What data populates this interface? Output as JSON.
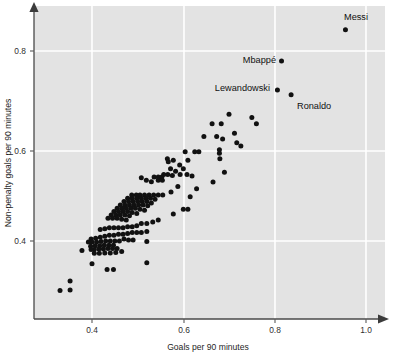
{
  "chart_data": {
    "type": "scatter",
    "title": "",
    "xlabel": "Goals per 90 minutes",
    "ylabel": "Non-penalty goals per 90 minutes",
    "xlim": [
      0.3,
      1.06
    ],
    "ylim": [
      0.28,
      0.9
    ],
    "xticks": [
      0.4,
      0.6,
      0.8,
      1.0
    ],
    "xtick_labels": [
      "0.4",
      "0.6",
      "0.8",
      "1.0"
    ],
    "yticks": [
      0.4,
      0.6,
      0.8
    ],
    "ytick_labels": [
      "0.4",
      "0.6",
      "0.8"
    ],
    "grid": true,
    "grid_color": "#ffffff",
    "plot_background": "#e3e3e3",
    "point_color": "#111111",
    "legend": "none",
    "annotations": [
      {
        "label": "Messi",
        "x": 0.955,
        "y": 0.845,
        "position": "above"
      },
      {
        "label": "Mbappé",
        "x": 0.815,
        "y": 0.779,
        "position": "left"
      },
      {
        "label": "Lewandowski",
        "x": 0.806,
        "y": 0.718,
        "position": "left"
      },
      {
        "label": "Ronaldo",
        "x": 0.836,
        "y": 0.708,
        "position": "right"
      }
    ],
    "points": [
      [
        0.955,
        0.845
      ],
      [
        0.815,
        0.779
      ],
      [
        0.806,
        0.718
      ],
      [
        0.836,
        0.708
      ],
      [
        0.7,
        0.667
      ],
      [
        0.663,
        0.647
      ],
      [
        0.683,
        0.647
      ],
      [
        0.75,
        0.66
      ],
      [
        0.76,
        0.647
      ],
      [
        0.712,
        0.627
      ],
      [
        0.645,
        0.62
      ],
      [
        0.673,
        0.62
      ],
      [
        0.686,
        0.615
      ],
      [
        0.717,
        0.607
      ],
      [
        0.726,
        0.6
      ],
      [
        0.679,
        0.592
      ],
      [
        0.679,
        0.585
      ],
      [
        0.68,
        0.573
      ],
      [
        0.625,
        0.588
      ],
      [
        0.634,
        0.588
      ],
      [
        0.604,
        0.588
      ],
      [
        0.61,
        0.57
      ],
      [
        0.565,
        0.573
      ],
      [
        0.567,
        0.567
      ],
      [
        0.578,
        0.57
      ],
      [
        0.592,
        0.56
      ],
      [
        0.6,
        0.552
      ],
      [
        0.572,
        0.552
      ],
      [
        0.583,
        0.547
      ],
      [
        0.557,
        0.54
      ],
      [
        0.566,
        0.54
      ],
      [
        0.576,
        0.538
      ],
      [
        0.593,
        0.54
      ],
      [
        0.608,
        0.54
      ],
      [
        0.619,
        0.537
      ],
      [
        0.536,
        0.535
      ],
      [
        0.545,
        0.535
      ],
      [
        0.553,
        0.535
      ],
      [
        0.545,
        0.528
      ],
      [
        0.554,
        0.528
      ],
      [
        0.53,
        0.525
      ],
      [
        0.519,
        0.528
      ],
      [
        0.508,
        0.533
      ],
      [
        0.69,
        0.545
      ],
      [
        0.665,
        0.524
      ],
      [
        0.629,
        0.51
      ],
      [
        0.615,
        0.493
      ],
      [
        0.588,
        0.515
      ],
      [
        0.573,
        0.503
      ],
      [
        0.555,
        0.497
      ],
      [
        0.545,
        0.497
      ],
      [
        0.535,
        0.497
      ],
      [
        0.525,
        0.497
      ],
      [
        0.515,
        0.497
      ],
      [
        0.505,
        0.497
      ],
      [
        0.497,
        0.497
      ],
      [
        0.487,
        0.497
      ],
      [
        0.478,
        0.49
      ],
      [
        0.488,
        0.49
      ],
      [
        0.498,
        0.49
      ],
      [
        0.508,
        0.49
      ],
      [
        0.518,
        0.49
      ],
      [
        0.528,
        0.49
      ],
      [
        0.538,
        0.488
      ],
      [
        0.47,
        0.483
      ],
      [
        0.48,
        0.483
      ],
      [
        0.49,
        0.483
      ],
      [
        0.5,
        0.483
      ],
      [
        0.51,
        0.483
      ],
      [
        0.52,
        0.483
      ],
      [
        0.53,
        0.48
      ],
      [
        0.462,
        0.476
      ],
      [
        0.472,
        0.476
      ],
      [
        0.482,
        0.476
      ],
      [
        0.492,
        0.476
      ],
      [
        0.502,
        0.476
      ],
      [
        0.512,
        0.476
      ],
      [
        0.522,
        0.474
      ],
      [
        0.455,
        0.469
      ],
      [
        0.465,
        0.469
      ],
      [
        0.475,
        0.469
      ],
      [
        0.485,
        0.469
      ],
      [
        0.495,
        0.469
      ],
      [
        0.505,
        0.467
      ],
      [
        0.515,
        0.465
      ],
      [
        0.448,
        0.462
      ],
      [
        0.458,
        0.462
      ],
      [
        0.468,
        0.462
      ],
      [
        0.478,
        0.462
      ],
      [
        0.488,
        0.46
      ],
      [
        0.498,
        0.458
      ],
      [
        0.442,
        0.455
      ],
      [
        0.452,
        0.455
      ],
      [
        0.462,
        0.455
      ],
      [
        0.472,
        0.455
      ],
      [
        0.482,
        0.453
      ],
      [
        0.435,
        0.448
      ],
      [
        0.445,
        0.448
      ],
      [
        0.455,
        0.448
      ],
      [
        0.465,
        0.446
      ],
      [
        0.475,
        0.444
      ],
      [
        0.6,
        0.467
      ],
      [
        0.61,
        0.467
      ],
      [
        0.578,
        0.457
      ],
      [
        0.545,
        0.444
      ],
      [
        0.533,
        0.44
      ],
      [
        0.52,
        0.437
      ],
      [
        0.508,
        0.437
      ],
      [
        0.498,
        0.432
      ],
      [
        0.488,
        0.43
      ],
      [
        0.478,
        0.43
      ],
      [
        0.468,
        0.428
      ],
      [
        0.458,
        0.428
      ],
      [
        0.448,
        0.428
      ],
      [
        0.438,
        0.428
      ],
      [
        0.428,
        0.426
      ],
      [
        0.418,
        0.424
      ],
      [
        0.52,
        0.42
      ],
      [
        0.508,
        0.418
      ],
      [
        0.498,
        0.418
      ],
      [
        0.488,
        0.418
      ],
      [
        0.478,
        0.416
      ],
      [
        0.468,
        0.414
      ],
      [
        0.458,
        0.414
      ],
      [
        0.448,
        0.412
      ],
      [
        0.438,
        0.412
      ],
      [
        0.428,
        0.41
      ],
      [
        0.418,
        0.408
      ],
      [
        0.408,
        0.406
      ],
      [
        0.398,
        0.404
      ],
      [
        0.47,
        0.404
      ],
      [
        0.48,
        0.402
      ],
      [
        0.49,
        0.402
      ],
      [
        0.46,
        0.4
      ],
      [
        0.45,
        0.4
      ],
      [
        0.44,
        0.4
      ],
      [
        0.43,
        0.4
      ],
      [
        0.42,
        0.399
      ],
      [
        0.41,
        0.398
      ],
      [
        0.4,
        0.398
      ],
      [
        0.392,
        0.398
      ],
      [
        0.52,
        0.399
      ],
      [
        0.447,
        0.391
      ],
      [
        0.437,
        0.391
      ],
      [
        0.427,
        0.391
      ],
      [
        0.417,
        0.39
      ],
      [
        0.407,
        0.39
      ],
      [
        0.397,
        0.389
      ],
      [
        0.455,
        0.384
      ],
      [
        0.445,
        0.384
      ],
      [
        0.435,
        0.384
      ],
      [
        0.425,
        0.383
      ],
      [
        0.415,
        0.383
      ],
      [
        0.405,
        0.382
      ],
      [
        0.398,
        0.382
      ],
      [
        0.465,
        0.378
      ],
      [
        0.452,
        0.376
      ],
      [
        0.44,
        0.375
      ],
      [
        0.428,
        0.375
      ],
      [
        0.416,
        0.374
      ],
      [
        0.405,
        0.374
      ],
      [
        0.378,
        0.38
      ],
      [
        0.52,
        0.354
      ],
      [
        0.4,
        0.352
      ],
      [
        0.433,
        0.34
      ],
      [
        0.447,
        0.34
      ],
      [
        0.352,
        0.316
      ],
      [
        0.33,
        0.296
      ],
      [
        0.352,
        0.297
      ]
    ]
  },
  "axes": {
    "x_title": "Goals per 90 minutes",
    "y_title": "Non-penalty goals per 90 minutes",
    "x_tick_0": "0.4",
    "x_tick_1": "0.6",
    "x_tick_2": "0.8",
    "x_tick_3": "1.0",
    "y_tick_0": "0.4",
    "y_tick_1": "0.6",
    "y_tick_2": "0.8"
  },
  "labels": {
    "messi": "Messi",
    "mbappe": "Mbappé",
    "lewandowski": "Lewandowski",
    "ronaldo": "Ronaldo"
  }
}
